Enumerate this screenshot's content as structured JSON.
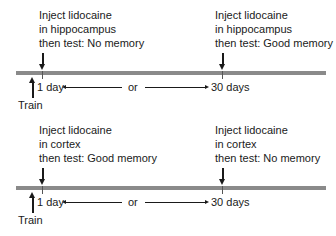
{
  "panels": [
    {
      "left_event": {
        "line1": "Inject lidocaine",
        "line2": "in hippocampus",
        "line3": "then test: No memory"
      },
      "right_event": {
        "line1": "Inject lidocaine",
        "line2": "in hippocampus",
        "line3": "then test: Good memory"
      },
      "train_label": "Train",
      "left_time": "1 day",
      "or_label": "or",
      "right_time": "30 days"
    },
    {
      "left_event": {
        "line1": "Inject lidocaine",
        "line2": "in cortex",
        "line3": "then test: Good memory"
      },
      "right_event": {
        "line1": "Inject lidocaine",
        "line2": "in cortex",
        "line3": "then test: No memory"
      },
      "train_label": "Train",
      "left_time": "1 day",
      "or_label": "or",
      "right_time": "30 days"
    }
  ],
  "colors": {
    "bar": "#8a8a8a",
    "text": "#1a1a1a",
    "background": "#ffffff"
  }
}
